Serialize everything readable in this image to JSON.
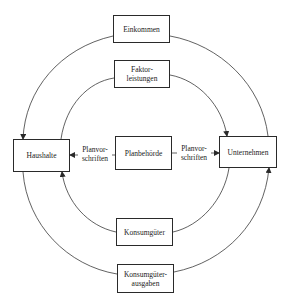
{
  "diagram": {
    "type": "circular-flow",
    "nodes": {
      "einkommen": {
        "line1": "Einkommen"
      },
      "faktorleistungen": {
        "line1": "Faktor-",
        "line2": "leistungen"
      },
      "haushalte": {
        "line1": "Haushalte"
      },
      "planbehoerde": {
        "line1": "Planbehörde"
      },
      "unternehmen": {
        "line1": "Unternehmen"
      },
      "konsumgueter": {
        "line1": "Konsumgüter"
      },
      "konsumgueterausgaben": {
        "line1": "Konsumgüter-",
        "line2": "ausgaben"
      }
    },
    "edge_labels": {
      "plan_left": {
        "line1": "Planvor-",
        "line2": "schriften"
      },
      "plan_right": {
        "line1": "Planvor-",
        "line2": "schriften"
      }
    },
    "edges": [
      {
        "from": "Unternehmen",
        "to": "Haushalte",
        "via": "Einkommen",
        "ring": "outer-top"
      },
      {
        "from": "Haushalte",
        "to": "Unternehmen",
        "via": "Faktorleistungen",
        "ring": "inner-top"
      },
      {
        "from": "Planbehörde",
        "to": "Haushalte",
        "label": "Planvorschriften"
      },
      {
        "from": "Planbehörde",
        "to": "Unternehmen",
        "label": "Planvorschriften"
      },
      {
        "from": "Unternehmen",
        "to": "Haushalte",
        "via": "Konsumgüter",
        "ring": "inner-bottom"
      },
      {
        "from": "Haushalte",
        "to": "Unternehmen",
        "via": "Konsumgüterausgaben",
        "ring": "outer-bottom"
      }
    ],
    "colors": {
      "line": "#3a3a3a",
      "box_border": "#2a2a2a",
      "text": "#222222",
      "background": "#ffffff"
    }
  }
}
